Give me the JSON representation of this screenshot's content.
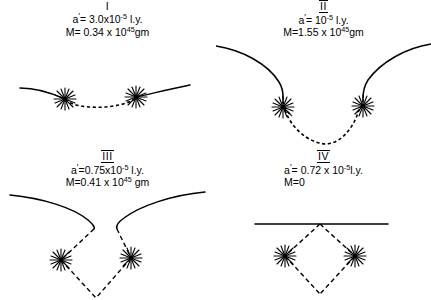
{
  "figure": {
    "background_color": "#ffffff",
    "ink_color": "#000000",
    "panel_count": 4
  },
  "panels": [
    {
      "id": "panel-1",
      "roman": "I",
      "roman_overlined": false,
      "separation_label": "a",
      "separation_prime": "′",
      "separation_eq": "= 3.0x10",
      "separation_exp": "-5",
      "separation_unit": " l.y.",
      "mass_label": "M",
      "mass_eq": "= 0.34 x 10",
      "mass_exp": "45",
      "mass_unit": "gm",
      "line_style": "solid-with-dashed-bridge",
      "geometry": "shallow-dip"
    },
    {
      "id": "panel-2",
      "roman": "II",
      "roman_overlined": true,
      "separation_label": "a",
      "separation_prime": "′",
      "separation_eq": "= 10",
      "separation_exp": "-5",
      "separation_unit": " l.y.",
      "mass_label": "M",
      "mass_eq": "=1.55 x 10",
      "mass_exp": "45",
      "mass_unit": "gm",
      "line_style": "solid-with-dashed-U",
      "geometry": "deep-funnel"
    },
    {
      "id": "panel-3",
      "roman": "III",
      "roman_overlined": true,
      "separation_label": "a",
      "separation_prime": "′",
      "separation_eq": "=0.75x10",
      "separation_exp": "-5",
      "separation_unit": " l.y.",
      "mass_label": "M",
      "mass_eq": "=0.41 x 10",
      "mass_exp": "45",
      "mass_unit": " gm",
      "line_style": "solid-cusp-with-dashed-diamond",
      "geometry": "pinched-cusp"
    },
    {
      "id": "panel-4",
      "roman": "IV",
      "roman_overlined": true,
      "separation_label": "a",
      "separation_prime": "′",
      "separation_eq": "= 0.72 x 10",
      "separation_exp": "-5",
      "separation_unit": "l.y.",
      "mass_label": "M",
      "mass_eq": "=0",
      "mass_exp": "",
      "mass_unit": "",
      "line_style": "straight-line-with-dashed-diamond",
      "geometry": "flat-plus-diamond"
    }
  ],
  "star_markers": {
    "name": "star-burst-marker",
    "count_per_panel": 2,
    "ray_count": 10
  }
}
